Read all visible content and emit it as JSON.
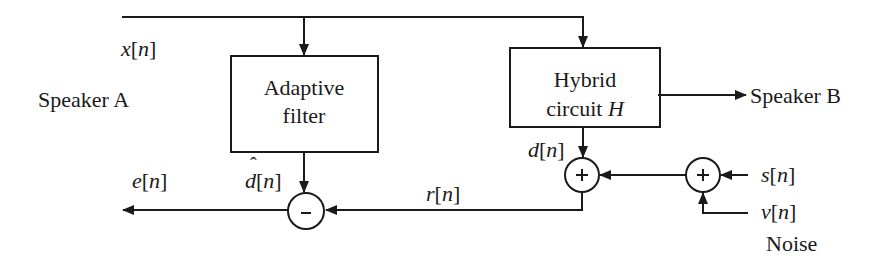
{
  "diagram": {
    "colors": {
      "stroke": "#1a1a1a",
      "background": "#ffffff"
    },
    "blocks": [
      {
        "id": "adaptive-filter",
        "lines": [
          "Adaptive",
          "filter"
        ]
      },
      {
        "id": "hybrid-circuit",
        "lines": [
          "Hybrid",
          "circuit "
        ],
        "symbol": "H"
      }
    ],
    "summing_junctions": [
      {
        "id": "subtractor",
        "sign": "-"
      },
      {
        "id": "adder-echo",
        "sign": "+"
      },
      {
        "id": "adder-noise",
        "sign": "+"
      }
    ],
    "signals": {
      "x": {
        "var": "x",
        "open": "[",
        "idx": "n",
        "close": "]"
      },
      "e": {
        "var": "e",
        "open": "[",
        "idx": "n",
        "close": "]"
      },
      "dhat": {
        "var": "d",
        "hat": "ˆ",
        "open": "[",
        "idx": "n",
        "close": "]"
      },
      "r": {
        "var": "r",
        "open": "[",
        "idx": "n",
        "close": "]"
      },
      "d": {
        "var": "d",
        "open": "[",
        "idx": "n",
        "close": "]"
      },
      "s": {
        "var": "s",
        "open": "[",
        "idx": "n",
        "close": "]"
      },
      "v": {
        "var": "v",
        "open": "[",
        "idx": "n",
        "close": "]"
      }
    },
    "labels": {
      "speaker_a": "Speaker A",
      "speaker_b": "Speaker B",
      "noise": "Noise"
    }
  }
}
